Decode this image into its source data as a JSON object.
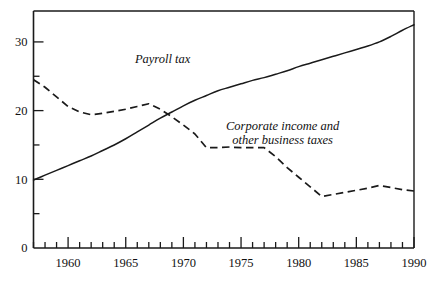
{
  "chart_data": {
    "type": "line",
    "title": "",
    "subtitle": "",
    "xlabel": "",
    "ylabel": "",
    "xlim": [
      1957,
      1990
    ],
    "ylim": [
      0,
      34.5
    ],
    "grid": false,
    "legend_position": "inline-annotation",
    "y_ticks_major": [
      0,
      10,
      20,
      30
    ],
    "y_ticks_minor": [
      5,
      15,
      25
    ],
    "y_tick_labels": [
      "0",
      "10",
      "20",
      "30"
    ],
    "x_ticks_major": [
      1960,
      1965,
      1970,
      1975,
      1980,
      1985,
      1990
    ],
    "x_tick_labels": [
      "1960",
      "1965",
      "1970",
      "1975",
      "1980",
      "1985",
      "1990"
    ],
    "x_ticks_minor": [
      1957,
      1958,
      1959,
      1961,
      1962,
      1963,
      1964,
      1966,
      1967,
      1968,
      1969,
      1971,
      1972,
      1973,
      1974,
      1976,
      1977,
      1978,
      1979,
      1981,
      1982,
      1983,
      1984,
      1986,
      1987,
      1988,
      1989
    ],
    "x": [
      1957,
      1958,
      1959,
      1960,
      1961,
      1962,
      1963,
      1964,
      1965,
      1966,
      1967,
      1968,
      1969,
      1970,
      1971,
      1972,
      1973,
      1974,
      1975,
      1976,
      1977,
      1978,
      1979,
      1980,
      1981,
      1982,
      1983,
      1984,
      1985,
      1986,
      1987,
      1988,
      1989,
      1990
    ],
    "series": [
      {
        "name": "Payroll tax",
        "style": "solid",
        "color": "#1a1a1a",
        "label_x": 1968.2,
        "label_y": 26.9,
        "values": [
          9.9,
          10.6,
          11.3,
          12.0,
          12.7,
          13.4,
          14.2,
          15.0,
          15.9,
          16.9,
          17.9,
          18.9,
          19.8,
          20.7,
          21.5,
          22.2,
          22.9,
          23.4,
          23.9,
          24.4,
          24.8,
          25.3,
          25.8,
          26.4,
          26.9,
          27.4,
          27.9,
          28.4,
          28.9,
          29.4,
          30.0,
          30.8,
          31.7,
          32.5
        ]
      },
      {
        "name": "Corporate income and other business taxes",
        "label_line_1": "Corporate income and",
        "label_line_2": "other business taxes",
        "style": "dashed",
        "color": "#1a1a1a",
        "label_x": 1978.6,
        "label_y": 17.2,
        "values": [
          24.5,
          23.4,
          22.0,
          20.6,
          19.8,
          19.4,
          19.6,
          19.9,
          20.2,
          20.6,
          21.0,
          20.2,
          19.1,
          17.9,
          16.6,
          14.6,
          14.6,
          14.7,
          14.6,
          14.6,
          14.6,
          13.3,
          11.7,
          10.3,
          8.9,
          7.5,
          7.8,
          8.1,
          8.4,
          8.7,
          9.1,
          8.8,
          8.5,
          8.3
        ]
      }
    ]
  },
  "annotations": {
    "payroll_tax": "Payroll tax",
    "corporate_line_1": "Corporate income and",
    "corporate_line_2": "other business taxes"
  }
}
